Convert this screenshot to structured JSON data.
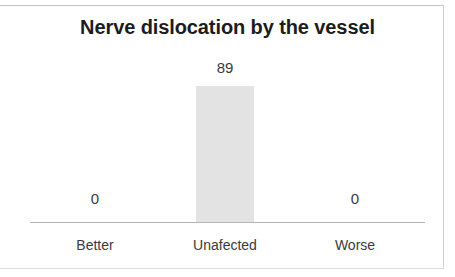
{
  "chart_data": {
    "type": "bar",
    "title": "Nerve dislocation by the vessel",
    "xlabel": "",
    "ylabel": "",
    "categories": [
      "Better",
      "Unafected",
      "Worse"
    ],
    "values": [
      0,
      89,
      0
    ],
    "data_labels": [
      "0",
      "89",
      "0"
    ],
    "ylim": [
      0,
      89
    ],
    "grid": false,
    "legend": false,
    "bar_color": "#e3e3e3",
    "axis_color": "#b5b5b5",
    "title_color": "#1c1c1c",
    "label_color": "#3a3a3a"
  },
  "figure": {
    "title": "Nerve dislocation by the vessel",
    "labels": {
      "better_value": "0",
      "unafected_value": "89",
      "worse_value": "0",
      "better_category": "Better",
      "unafected_category": "Unafected",
      "worse_category": "Worse"
    }
  }
}
